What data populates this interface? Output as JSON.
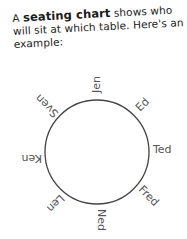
{
  "intro": {
    "prefix": "A ",
    "term": "seating chart",
    "suffix": " shows who will sit at which table. Here's an example:"
  },
  "chart": {
    "shape": "circle",
    "stroke_color": "#444444",
    "names": [
      {
        "label": "Jen",
        "angle": -90
      },
      {
        "label": "Ed",
        "angle": -45
      },
      {
        "label": "Ted",
        "angle": 0
      },
      {
        "label": "Fred",
        "angle": 45
      },
      {
        "label": "Ned",
        "angle": 90
      },
      {
        "label": "Len",
        "angle": 135
      },
      {
        "label": "Ken",
        "angle": 180
      },
      {
        "label": "Sven",
        "angle": 225
      }
    ]
  }
}
